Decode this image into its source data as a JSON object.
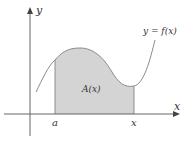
{
  "diagram": {
    "labels": {
      "y_axis": "y",
      "x_axis": "x",
      "curve": "y = f(x)",
      "area": "A(x)",
      "left_bound": "a",
      "right_bound": "x"
    },
    "colors": {
      "axis": "#555555",
      "curve": "#8a8a8a",
      "fill": "#d4d4d4",
      "text": "#333333"
    }
  }
}
